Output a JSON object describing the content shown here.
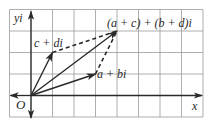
{
  "figure": {
    "type": "complex-plane-vector-addition",
    "grid": {
      "cols": 9,
      "rows": 5,
      "cell_px": 21.5,
      "origin_col": 1,
      "origin_row": 4,
      "color": "#9a9a9a",
      "border_color": "#8a8a8a"
    },
    "axes": {
      "x_label": "x",
      "y_label": "yi",
      "origin_label": "O",
      "color": "#2a2a2a"
    },
    "vectors": [
      {
        "name": "a-plus-bi",
        "label": "a + bi",
        "to": [
          3,
          1
        ],
        "style": "solid"
      },
      {
        "name": "c-plus-di",
        "label": "c + di",
        "to": [
          1,
          2
        ],
        "style": "solid"
      },
      {
        "name": "sum",
        "label": "(a + c) + (b + d)i",
        "to": [
          4,
          3
        ],
        "style": "solid"
      }
    ],
    "dashed_edges": [
      {
        "name": "dashed-c-to-sum",
        "from": [
          1,
          2
        ],
        "to": [
          4,
          3
        ]
      },
      {
        "name": "dashed-a-to-sum",
        "from": [
          3,
          1
        ],
        "to": [
          4,
          3
        ]
      }
    ]
  }
}
